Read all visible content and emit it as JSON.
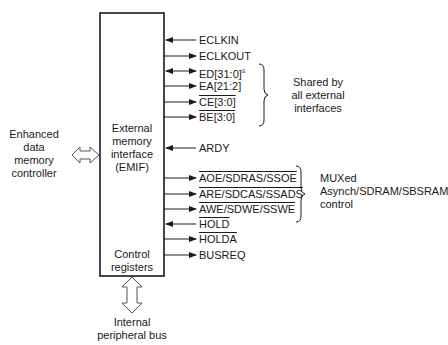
{
  "block": {
    "title_lines": [
      "External",
      "memory",
      "interface",
      "(EMIF)"
    ],
    "footer_lines": [
      "Control",
      "registers"
    ]
  },
  "left_peer": {
    "label_lines": [
      "Enhanced",
      "data",
      "memory",
      "controller"
    ],
    "connection": "bidirectional-arrow"
  },
  "bottom_peer": {
    "label_lines": [
      "Internal",
      "peripheral bus"
    ],
    "connection": "bidirectional-arrow"
  },
  "signals": [
    {
      "name": "ECLKIN",
      "direction": "in",
      "overline": false,
      "y": 40
    },
    {
      "name": "ECLKOUT",
      "direction": "out",
      "overline": false,
      "y": 56
    },
    {
      "name": "ED[31:0]",
      "suffix": "≤",
      "direction": "bidir",
      "overline": false,
      "y": 71
    },
    {
      "name": "EA[21:2]",
      "direction": "out",
      "overline": false,
      "y": 86
    },
    {
      "name": "CE[3:0]",
      "direction": "out",
      "overline": true,
      "y": 102
    },
    {
      "name": "BE[3:0]",
      "direction": "out",
      "overline": true,
      "y": 117
    },
    {
      "name": "ARDY",
      "direction": "in",
      "overline": false,
      "y": 148
    },
    {
      "name": "AOE/SDRAS/SSOE",
      "direction": "out",
      "overline": true,
      "y": 178
    },
    {
      "name": "ARE/SDCAS/SSADS",
      "direction": "out",
      "overline": true,
      "y": 194
    },
    {
      "name": "AWE/SDWE/SSWE",
      "direction": "out",
      "overline": true,
      "y": 209
    },
    {
      "name": "HOLD",
      "direction": "in",
      "overline": true,
      "y": 224
    },
    {
      "name": "HOLDA",
      "direction": "out",
      "overline": true,
      "y": 239
    },
    {
      "name": "BUSREQ",
      "direction": "out",
      "overline": false,
      "y": 255
    }
  ],
  "groups": [
    {
      "label_lines": [
        "Shared by",
        "all external",
        "interfaces"
      ],
      "brace": "right-brace"
    },
    {
      "label_lines": [
        "MUXed",
        "Asynch/SDRAM/SBSRAM",
        "control"
      ],
      "brace": "right-brace"
    }
  ]
}
